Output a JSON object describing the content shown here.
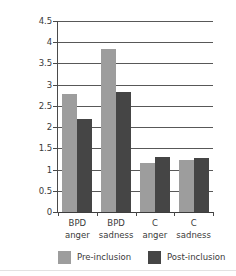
{
  "chart_data": {
    "type": "bar",
    "title": "",
    "xlabel": "",
    "ylabel": "",
    "ylim": [
      0,
      4.5
    ],
    "grid": true,
    "legend_position": "bottom",
    "categories": [
      "BPD anger",
      "BPD sadness",
      "C anger",
      "C sadness"
    ],
    "category_lines": [
      {
        "line1": "BPD",
        "line2": "anger"
      },
      {
        "line1": "BPD",
        "line2": "sadness"
      },
      {
        "line1": "C",
        "line2": "anger"
      },
      {
        "line1": "C",
        "line2": "sadness"
      }
    ],
    "series": [
      {
        "name": "Pre-inclusion",
        "color": "#9d9d9d",
        "values": [
          2.78,
          3.85,
          1.15,
          1.22
        ]
      },
      {
        "name": "Post-inclusion",
        "color": "#454545",
        "values": [
          2.19,
          2.82,
          1.3,
          1.28
        ]
      }
    ],
    "y_ticks": [
      "0",
      "0.5",
      "1",
      "1.5",
      "2",
      "2.5",
      "3",
      "3.5",
      "4",
      "4.5"
    ],
    "y_tick_values": [
      0,
      0.5,
      1,
      1.5,
      2,
      2.5,
      3,
      3.5,
      4,
      4.5
    ]
  },
  "legend": {
    "entries": [
      {
        "label": "Pre-inclusion"
      },
      {
        "label": "Post-inclusion"
      }
    ]
  },
  "colors": {
    "pre_inclusion": "#9d9d9d",
    "post_inclusion": "#454545",
    "gridline": "#585858",
    "axis": "#4a4a4a",
    "text": "#3a3a3a",
    "background": "#ffffff"
  }
}
